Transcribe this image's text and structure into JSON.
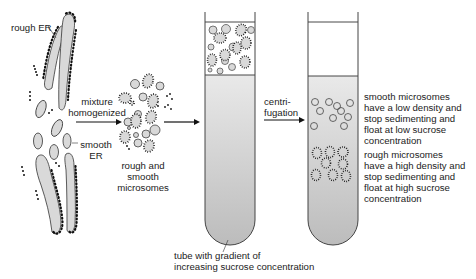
{
  "diagram": {
    "type": "process-flow",
    "labels": {
      "rough_er": "rough ER",
      "smooth_er_line1": "smooth",
      "smooth_er_line2": "ER",
      "step1_line1": "mixture",
      "step1_line2": "homogenized",
      "mixture_line1": "rough and",
      "mixture_line2": "smooth",
      "mixture_line3": "microsomes",
      "step2_line1": "centri-",
      "step2_line2": "fugation",
      "tube_line1": "tube with gradient of",
      "tube_line2": "increasing sucrose concentration",
      "smooth_result": [
        "smooth microsomes",
        "have a low density and",
        "stop sedimenting and",
        "float at low sucrose",
        "concentration"
      ],
      "rough_result": [
        "rough microsomes",
        "have a high density and",
        "stop sedimenting and",
        "float at high sucrose",
        "concentration"
      ]
    },
    "colors": {
      "membrane_fill": "#d9d9d9",
      "outline": "#333333",
      "ribosome": "#111111",
      "tube_gradient_top": "#e6e6e6",
      "tube_gradient_bottom": "#bdbdbd"
    }
  }
}
